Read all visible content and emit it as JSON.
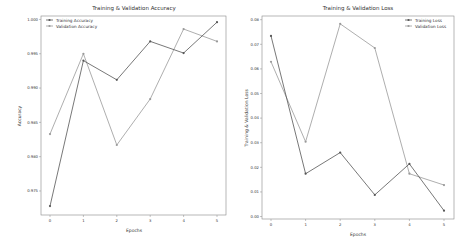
{
  "chart_data": [
    {
      "type": "line",
      "title": "Training & Validation Accuracy",
      "xlabel": "Epochs",
      "ylabel": "Accuracy",
      "x": [
        0,
        1,
        2,
        3,
        4,
        5
      ],
      "xticks": [
        "0",
        "1",
        "2",
        "3",
        "4",
        "5"
      ],
      "yticks": [
        "0.975",
        "0.980",
        "0.985",
        "0.990",
        "0.995",
        "1.000"
      ],
      "ytick_values": [
        0.975,
        0.98,
        0.985,
        0.99,
        0.995,
        1.0
      ],
      "ylim": [
        0.9715,
        1.0005
      ],
      "grid": false,
      "legend_position": "upper left",
      "series": [
        {
          "name": "Training Accuracy",
          "values": [
            0.9728,
            0.994,
            0.9912,
            0.9968,
            0.9951,
            0.9996
          ],
          "color": "#555555",
          "marker": "circle"
        },
        {
          "name": "Validation Accuracy",
          "values": [
            0.9833,
            0.995,
            0.9817,
            0.9884,
            0.9986,
            0.9968
          ],
          "color": "#999999",
          "marker": "circle"
        }
      ]
    },
    {
      "type": "line",
      "title": "Training & Validation Loss",
      "xlabel": "Epochs",
      "ylabel": "Training & Validation Loss",
      "x": [
        0,
        1,
        2,
        3,
        4,
        5
      ],
      "xticks": [
        "0",
        "1",
        "2",
        "3",
        "4",
        "5"
      ],
      "yticks": [
        "0.00",
        "0.01",
        "0.02",
        "0.03",
        "0.04",
        "0.05",
        "0.06",
        "0.07",
        "0.08"
      ],
      "ytick_values": [
        0.0,
        0.01,
        0.02,
        0.03,
        0.04,
        0.05,
        0.06,
        0.07,
        0.08
      ],
      "ylim": [
        -0.001,
        0.0815
      ],
      "grid": false,
      "legend_position": "upper right",
      "series": [
        {
          "name": "Training Loss",
          "values": [
            0.0734,
            0.0174,
            0.026,
            0.0088,
            0.0214,
            0.0024
          ],
          "color": "#555555",
          "marker": "circle"
        },
        {
          "name": "Validation Loss",
          "values": [
            0.0629,
            0.0304,
            0.0783,
            0.0685,
            0.0174,
            0.0128
          ],
          "color": "#999999",
          "marker": "circle"
        }
      ]
    }
  ],
  "left": {
    "title": "Training & Validation Accuracy",
    "xlabel": "Epochs",
    "ylabel": "Accuracy",
    "legend": [
      "Training Accuracy",
      "Validation Accuracy"
    ]
  },
  "right": {
    "title": "Training & Validation Loss",
    "xlabel": "Epochs",
    "ylabel": "Training & Validation Loss",
    "legend": [
      "Training Loss",
      "Validation Loss"
    ]
  }
}
